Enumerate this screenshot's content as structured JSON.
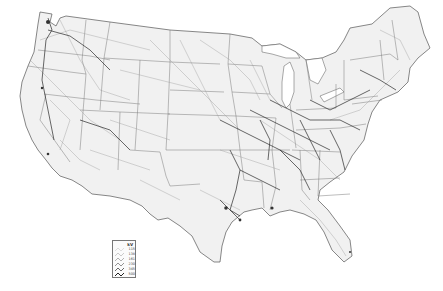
{
  "map": {
    "subject": "Contiguous United States electric transmission lines",
    "style": "grayscale line network on light gray land, white background",
    "colors": {
      "background": "#ffffff",
      "land": "#f1f1f1",
      "state_border": "#7a7a7a",
      "coast": "#555555",
      "lines_light": "#9a9a9a",
      "lines_dark": "#2a2a2a",
      "water_lake": "#ffffff"
    }
  },
  "legend": {
    "title": "kV",
    "items": [
      {
        "label": "115",
        "width": 0.4,
        "color": "#b0b0b0"
      },
      {
        "label": "138",
        "width": 0.5,
        "color": "#999999"
      },
      {
        "label": "161",
        "width": 0.6,
        "color": "#808080"
      },
      {
        "label": "230",
        "width": 0.7,
        "color": "#666666"
      },
      {
        "label": "345",
        "width": 0.8,
        "color": "#444444"
      },
      {
        "label": "500",
        "width": 1.0,
        "color": "#222222"
      }
    ]
  }
}
